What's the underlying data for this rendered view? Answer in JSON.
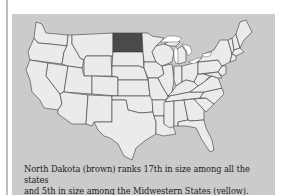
{
  "figure": {
    "type": "us-states-map",
    "highlighted_state": {
      "name": "North Dakota",
      "color": "#4a4a4a"
    },
    "state_fill_color": "#ebebeb",
    "border_color": "#3a3a3a",
    "background_color": "#cbcbcb",
    "lakes_color": "#ffffff"
  },
  "caption": {
    "line1": "North Dakota (brown) ranks 17th in size among all the states",
    "line2": "and 5th in size among the Midwestern States (yellow)."
  }
}
